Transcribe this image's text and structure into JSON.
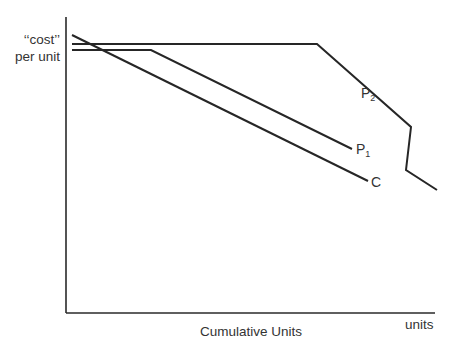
{
  "chart_data": {
    "type": "line",
    "title": "",
    "xlabel": "Cumulative Units",
    "x_end_label": "units",
    "ylabel_line1": "‘‘cost’’",
    "ylabel_line2": "per unit",
    "grid": false,
    "legend": "inline labels at line ends",
    "axes_px": {
      "origin": [
        66,
        313
      ],
      "x_end": 435,
      "y_top": 17
    },
    "series": [
      {
        "name": "P2",
        "label_main": "P",
        "label_sub": "2",
        "points_px": [
          [
            72,
            44
          ],
          [
            317,
            44
          ],
          [
            411,
            127
          ],
          [
            406,
            170
          ],
          [
            437,
            190
          ]
        ],
        "label_pos_px": [
          361,
          86
        ]
      },
      {
        "name": "P1",
        "label_main": "P",
        "label_sub": "1",
        "points_px": [
          [
            72,
            50
          ],
          [
            151,
            50
          ],
          [
            352,
            149
          ]
        ],
        "label_pos_px": [
          356,
          142
        ]
      },
      {
        "name": "C",
        "label_main": "C",
        "label_sub": "",
        "points_px": [
          [
            72,
            35
          ],
          [
            368,
            181
          ]
        ],
        "label_pos_px": [
          371,
          175
        ]
      }
    ]
  }
}
